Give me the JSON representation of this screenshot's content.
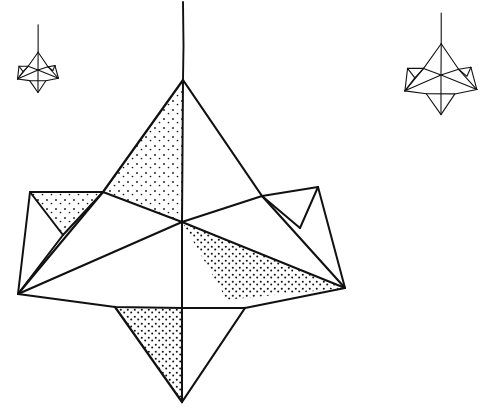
{
  "figure": {
    "medium": "pen-and-ink line drawing",
    "background_color": "#ffffff",
    "ink_color": "#111111",
    "stipple_color": "#1a1a1a",
    "canvas": {
      "width": 498,
      "height": 414
    },
    "objects": [
      {
        "name": "small-star-left",
        "label": "Small stellated solid (upper left)",
        "center_x": 38,
        "center_y": 70,
        "scale": 0.125,
        "stroke_width": 1.1,
        "stippled": false
      },
      {
        "name": "main-star-center",
        "label": "Main stellated solid (center)",
        "center_x": 182,
        "center_y": 222,
        "scale": 1.0,
        "stroke_width": 2.0,
        "stippled": true
      },
      {
        "name": "small-star-right",
        "label": "Small stellated solid (upper right)",
        "center_x": 441,
        "center_y": 75,
        "scale": 0.22,
        "stroke_width": 1.1,
        "stippled": false
      }
    ],
    "main_geometry": {
      "center": [
        182,
        222
      ],
      "apex_top": [
        183,
        80
      ],
      "apex_bottom": [
        182,
        402
      ],
      "hanging_line_top": [
        183,
        2
      ],
      "upper_pyramid_base_left": [
        103,
        192
      ],
      "upper_pyramid_base_right": [
        262,
        196
      ],
      "left_point": [
        18,
        294
      ],
      "right_point": [
        345,
        288
      ],
      "left_wing_outer": [
        30,
        192
      ],
      "left_wing_tip": [
        63,
        235
      ],
      "right_wing_outer": [
        318,
        187
      ],
      "right_wing_tip": [
        300,
        228
      ],
      "lower_spike_left": [
        115,
        307
      ],
      "lower_spike_right": [
        245,
        308
      ]
    },
    "shaded_faces": [
      {
        "name": "upper-front-right-face",
        "shading": "stipple",
        "density": "light"
      },
      {
        "name": "left-wing-upper-face",
        "shading": "stipple",
        "density": "light"
      },
      {
        "name": "lower-right-face",
        "shading": "stipple",
        "density": "medium"
      },
      {
        "name": "lower-spike-left-face",
        "shading": "stipple",
        "density": "medium"
      }
    ]
  }
}
